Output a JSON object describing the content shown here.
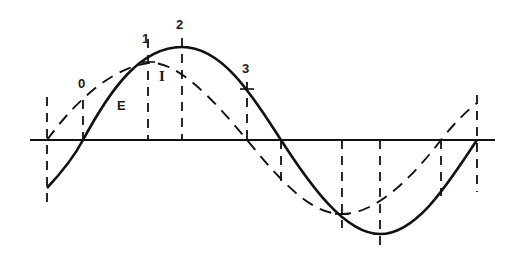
{
  "colors": {
    "ink": "#111111",
    "background": "#ffffff"
  },
  "axis": {
    "y": 140,
    "x_start": 30,
    "x_end": 495
  },
  "curves": [
    {
      "name": "E",
      "label": "E",
      "style": "solid",
      "zero_rise": 83,
      "zero_fall": 281,
      "zero_rise2": 477,
      "peak": {
        "x": 182,
        "y": 47
      },
      "trough": {
        "x": 380,
        "y": 234
      },
      "start": {
        "x": 47,
        "y": 188
      }
    },
    {
      "name": "I",
      "label": "I",
      "style": "dashed",
      "zero_rise": 47,
      "zero_fall": 247,
      "zero_rise2": 441,
      "peak": {
        "x": 148,
        "y": 68
      },
      "trough": {
        "x": 342,
        "y": 214
      },
      "end": {
        "x": 477,
        "y": 103
      }
    }
  ],
  "labels": {
    "point_0": "0",
    "point_1": "1",
    "point_2": "2",
    "point_3": "3",
    "curve_e": "E",
    "curve_i": "I"
  },
  "guides_x": [
    47,
    83,
    148,
    182,
    247,
    281,
    342,
    380,
    441,
    477
  ]
}
